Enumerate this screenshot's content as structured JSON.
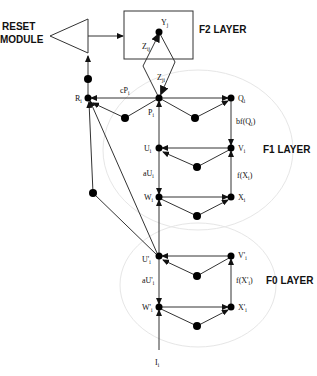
{
  "reset": {
    "line1": "RESET",
    "line2": "MODULE"
  },
  "layers": {
    "f2": "F2 LAYER",
    "f1": "F1 LAYER",
    "f0": "F0 LAYER"
  },
  "nodes": {
    "y": "Y",
    "y_sub": "j",
    "r": "R",
    "r_sub": "i",
    "p": "P",
    "p_sub": "i",
    "q": "Q",
    "q_sub": "i",
    "u": "U",
    "u_sub": "i",
    "v": "V",
    "v_sub": "i",
    "w": "W",
    "w_sub": "i",
    "x": "X",
    "x_sub": "i",
    "u0": "U'",
    "u0_sub": "i",
    "v0": "V'",
    "v0_sub": "i",
    "w0": "W'",
    "w0_sub": "i",
    "x0": "X'",
    "x0_sub": "i",
    "input": "I",
    "input_sub": "i"
  },
  "edges": {
    "zij": "Z",
    "zij_sub": "ij",
    "zji": "Z",
    "zji_sub": "ji",
    "cp": "cP",
    "cp_sub": "i",
    "bfq": "bf(Q",
    "bfq_sub": "i",
    "bfq_end": ")",
    "fx": "f(X",
    "fx_sub": "i",
    "fx_end": ")",
    "au": "aU",
    "au_sub": "i",
    "fx0": "f(X'",
    "fx0_sub": "i",
    "fx0_end": ")",
    "au0": "aU'",
    "au0_sub": "i"
  }
}
